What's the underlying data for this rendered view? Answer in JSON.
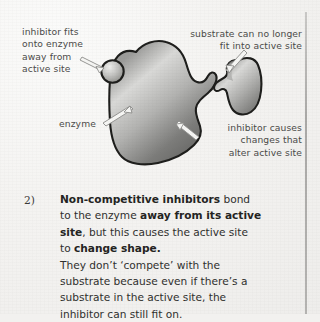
{
  "page": {
    "background_color": "#f2f1ef",
    "text_color": "#2f2f2d",
    "rule_color": "#a9a8a6"
  },
  "diagram": {
    "shapes": {
      "enzyme": {
        "name": "enzyme",
        "fill_light": "#d8d8d6",
        "fill_dark": "#6f6f6d",
        "outline": "#1d1d1b"
      },
      "inhibitor": {
        "name": "inhibitor",
        "fill_light": "#e2e2e0",
        "fill_dark": "#8a8a88",
        "outline": "#1d1d1b"
      },
      "substrate": {
        "name": "substrate",
        "fill_light": "#dcdcda",
        "fill_dark": "#797977",
        "outline": "#1d1d1b"
      }
    },
    "annotations": [
      {
        "id": "inhibitor-fits",
        "text": "inhibitor fits\nonto enzyme\naway from\nactive site"
      },
      {
        "id": "substrate-no-longer-fits",
        "text": "substrate can no longer\nfit into active site"
      },
      {
        "id": "enzyme",
        "text": "enzyme"
      },
      {
        "id": "inhibitor-causes-changes",
        "text": "inhibitor causes\nchanges that\nalter active site"
      }
    ]
  },
  "body": {
    "marker": "2)",
    "lines": [
      {
        "segments": [
          {
            "text": "Non-competitive inhibitors",
            "bold": true
          },
          {
            "text": " bond",
            "bold": false
          }
        ]
      },
      {
        "segments": [
          {
            "text": "to the enzyme ",
            "bold": false
          },
          {
            "text": "away from its active",
            "bold": true
          }
        ]
      },
      {
        "segments": [
          {
            "text": "site",
            "bold": true
          },
          {
            "text": ", but this causes the active site",
            "bold": false
          }
        ]
      },
      {
        "segments": [
          {
            "text": "to ",
            "bold": false
          },
          {
            "text": "change shape.",
            "bold": true
          }
        ]
      },
      {
        "segments": [
          {
            "text": "They don’t ‘compete’ with the",
            "bold": false
          }
        ]
      },
      {
        "segments": [
          {
            "text": "substrate because even if there’s a",
            "bold": false
          }
        ]
      },
      {
        "segments": [
          {
            "text": "substrate in the active site, the",
            "bold": false
          }
        ]
      },
      {
        "segments": [
          {
            "text": "inhibitor can still fit on.",
            "bold": false
          }
        ]
      }
    ]
  }
}
